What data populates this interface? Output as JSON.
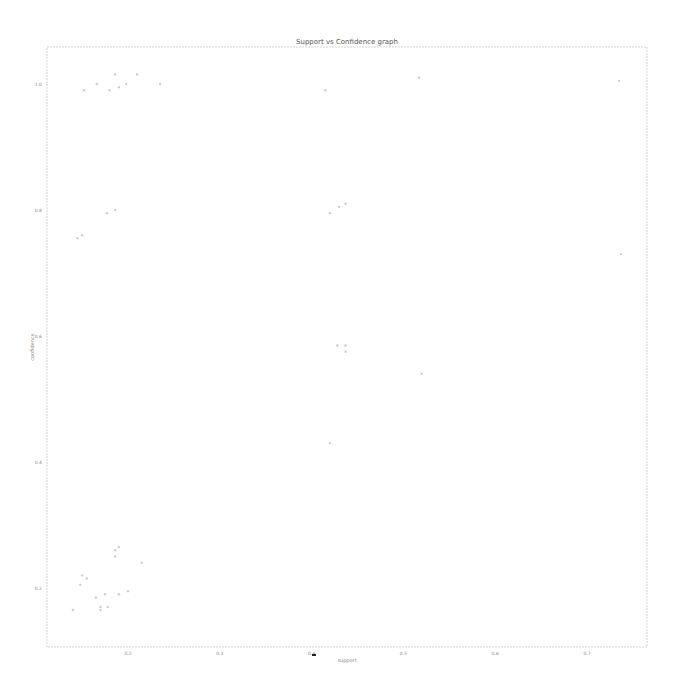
{
  "chart_data": {
    "type": "scatter",
    "title": "Support vs Confidence graph",
    "xlabel": "support",
    "ylabel": "confidence",
    "xlim": [
      0.11,
      0.76
    ],
    "ylim": [
      0.13,
      1.06
    ],
    "xticks": [
      0.2,
      0.3,
      0.4,
      0.5,
      0.6,
      0.7
    ],
    "xtick_labels": [
      "0.2",
      "0.3",
      "0.4",
      "0.5",
      "0.6",
      "0.7"
    ],
    "yticks": [
      0.2,
      0.4,
      0.6,
      0.8,
      1.0
    ],
    "ytick_labels": [
      "0.2",
      "0.4",
      "0.6",
      "0.8",
      "1.0"
    ],
    "grid": false,
    "legend": null,
    "points_note": "Approximate positions estimated from very faint markers; some points may be missing or spurious.",
    "points": [
      {
        "x": 0.152,
        "y": 0.99
      },
      {
        "x": 0.166,
        "y": 1.0
      },
      {
        "x": 0.18,
        "y": 0.99
      },
      {
        "x": 0.186,
        "y": 1.015
      },
      {
        "x": 0.19,
        "y": 0.995
      },
      {
        "x": 0.198,
        "y": 1.0
      },
      {
        "x": 0.21,
        "y": 1.015
      },
      {
        "x": 0.235,
        "y": 1.0
      },
      {
        "x": 0.415,
        "y": 0.99
      },
      {
        "x": 0.517,
        "y": 1.01
      },
      {
        "x": 0.735,
        "y": 1.005
      },
      {
        "x": 0.145,
        "y": 0.755
      },
      {
        "x": 0.15,
        "y": 0.76
      },
      {
        "x": 0.177,
        "y": 0.795
      },
      {
        "x": 0.186,
        "y": 0.8
      },
      {
        "x": 0.42,
        "y": 0.795
      },
      {
        "x": 0.43,
        "y": 0.805
      },
      {
        "x": 0.437,
        "y": 0.81
      },
      {
        "x": 0.737,
        "y": 0.73
      },
      {
        "x": 0.428,
        "y": 0.585
      },
      {
        "x": 0.437,
        "y": 0.585
      },
      {
        "x": 0.437,
        "y": 0.575
      },
      {
        "x": 0.52,
        "y": 0.54
      },
      {
        "x": 0.42,
        "y": 0.43
      },
      {
        "x": 0.186,
        "y": 0.26
      },
      {
        "x": 0.19,
        "y": 0.265
      },
      {
        "x": 0.186,
        "y": 0.25
      },
      {
        "x": 0.215,
        "y": 0.24
      },
      {
        "x": 0.15,
        "y": 0.22
      },
      {
        "x": 0.155,
        "y": 0.215
      },
      {
        "x": 0.148,
        "y": 0.205
      },
      {
        "x": 0.175,
        "y": 0.19
      },
      {
        "x": 0.19,
        "y": 0.19
      },
      {
        "x": 0.2,
        "y": 0.195
      },
      {
        "x": 0.165,
        "y": 0.185
      },
      {
        "x": 0.14,
        "y": 0.165
      },
      {
        "x": 0.17,
        "y": 0.165
      },
      {
        "x": 0.17,
        "y": 0.17
      },
      {
        "x": 0.178,
        "y": 0.17
      }
    ]
  },
  "figure": {
    "annotation_marker": "small black marker below x-axis near 0.4"
  }
}
